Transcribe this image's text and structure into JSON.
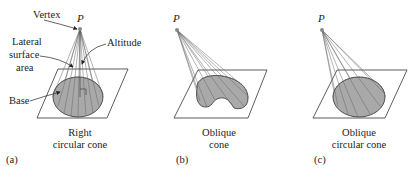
{
  "figure": {
    "panels": [
      {
        "id": "a",
        "panel_label": "(a)",
        "caption_line1": "Right",
        "caption_line2": "circular cone",
        "vertex_label": "P",
        "annotations": {
          "vertex": "Vertex",
          "lateral_line1": "Lateral",
          "lateral_line2": "surface",
          "lateral_line3": "area",
          "altitude": "Altitude",
          "base": "Base"
        }
      },
      {
        "id": "b",
        "panel_label": "(b)",
        "caption_line1": "Oblique",
        "caption_line2": "cone",
        "vertex_label": "P"
      },
      {
        "id": "c",
        "panel_label": "(c)",
        "caption_line1": "Oblique",
        "caption_line2": "circular cone",
        "vertex_label": "P"
      }
    ],
    "colors": {
      "base_fill": "#a9a9a9",
      "line": "#333333",
      "generator_line": "#777777",
      "vertex_dot": "#888888"
    }
  }
}
